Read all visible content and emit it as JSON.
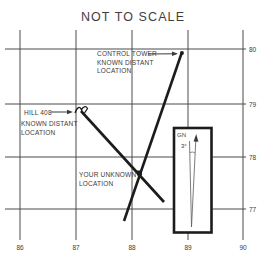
{
  "title": "NOT TO SCALE",
  "colors": {
    "background": "#ffffff",
    "ink": "#1c1c1c",
    "grid": "#4a4a4a",
    "text": "#3a3a3a"
  },
  "axes": {
    "x": [
      "86",
      "87",
      "88",
      "89",
      "90"
    ],
    "y": [
      "80",
      "79",
      "78",
      "77"
    ]
  },
  "annotations": {
    "control_tower": {
      "line1": "CONTROL TOWER",
      "line2": "KNOWN DISTANT",
      "line3": "LOCATION"
    },
    "hill": {
      "line1": "HILL 408",
      "line2": "KNOWN DISTANT",
      "line3": "LOCATION"
    },
    "unknown": {
      "line1": "YOUR UNKNOWN",
      "line2": "LOCATION"
    },
    "declination": {
      "grid_north": "GN",
      "angle": "3°"
    }
  }
}
